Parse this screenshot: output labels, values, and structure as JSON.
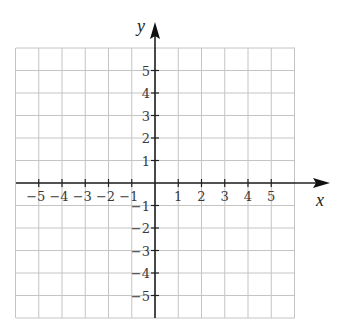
{
  "figure": {
    "type": "coordinate-plane",
    "x_axis_label": "x",
    "y_axis_label": "y",
    "x_ticks": [
      "−5",
      "−4",
      "−3",
      "−2",
      "−1",
      "1",
      "2",
      "3",
      "4",
      "5"
    ],
    "y_ticks_positive": [
      "5",
      "4",
      "3",
      "2",
      "1"
    ],
    "y_ticks_negative": [
      "−1",
      "−2",
      "−3",
      "−4",
      "−5"
    ],
    "grid_range": {
      "x": [
        -6,
        6
      ],
      "y": [
        -6,
        6
      ]
    },
    "colors": {
      "grid": "#bdbdbd",
      "axis": "#222222",
      "text": "#3a3a3a"
    }
  }
}
